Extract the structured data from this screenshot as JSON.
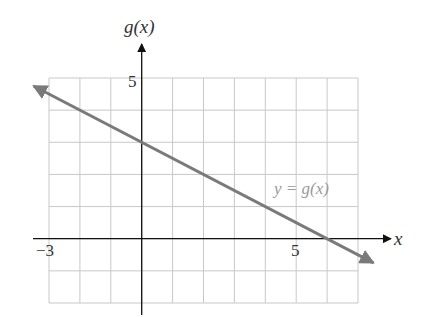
{
  "chart_data": {
    "type": "line",
    "title": "",
    "xlabel": "x",
    "ylabel": "g(x)",
    "xlim": [
      -3,
      7
    ],
    "ylim": [
      -2,
      5
    ],
    "grid": true,
    "x_tick_labels": [
      {
        "value": -3,
        "label": "−3"
      },
      {
        "value": 5,
        "label": "5"
      }
    ],
    "y_tick_labels": [
      {
        "value": 5,
        "label": "5"
      }
    ],
    "series": [
      {
        "name": "y = g(x)",
        "equation": "g(x) = 3 - x/2",
        "slope": -0.5,
        "intercept": 3,
        "x": [
          -3.5,
          0,
          6,
          7.5
        ],
        "values": [
          4.75,
          3,
          0,
          -0.75
        ],
        "color": "#7a7a7a",
        "arrows": "both"
      }
    ],
    "annotations": [
      {
        "text": "y = g(x)",
        "x": 5.2,
        "y": 1.6
      }
    ]
  },
  "labels": {
    "y_axis": "g(x)",
    "x_axis": "x",
    "tick_x_neg3": "−3",
    "tick_x_5": "5",
    "tick_y_5": "5",
    "curve": "y = g(x)"
  },
  "colors": {
    "grid": "#c8c8c8",
    "axis": "#111111",
    "line": "#7a7a7a",
    "annotation": "#9a9a9a"
  }
}
